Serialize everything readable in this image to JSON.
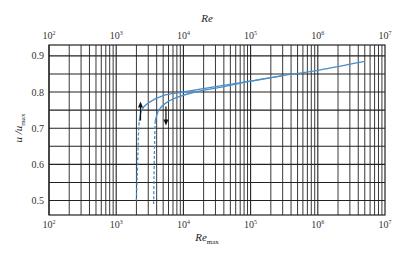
{
  "chart_data": {
    "type": "line",
    "title": "",
    "xlabel_top": "Re",
    "xlabel_bottom": "Re_max",
    "xlabel_bottom_main": "Re",
    "xlabel_bottom_sub": "max",
    "ylabel_main": "u /u",
    "ylabel_sub": "max",
    "x_scale": "log",
    "xlim": [
      100,
      10000000
    ],
    "ylim": [
      0.46,
      0.93
    ],
    "grid": true,
    "x_ticks": [
      {
        "value": 100,
        "base": "10",
        "exp": "2"
      },
      {
        "value": 1000,
        "base": "10",
        "exp": "3"
      },
      {
        "value": 10000,
        "base": "10",
        "exp": "4"
      },
      {
        "value": 100000,
        "base": "10",
        "exp": "5"
      },
      {
        "value": 1000000,
        "base": "10",
        "exp": "6"
      },
      {
        "value": 10000000,
        "base": "10",
        "exp": "7"
      }
    ],
    "y_ticks": [
      "0.5",
      "0.6",
      "0.7",
      "0.8",
      "0.9"
    ],
    "series": [
      {
        "name": "u/u_max vs Re (lower axis shift, left curve)",
        "color": "#4a8fc9",
        "laminar_dashed": {
          "x": [
            2000,
            2050,
            2100,
            2150,
            2200
          ],
          "y": [
            0.5,
            0.56,
            0.63,
            0.69,
            0.72
          ]
        },
        "turbulent": {
          "x": [
            2200,
            2400,
            3000,
            5000,
            10000,
            30000,
            100000,
            300000,
            1000000,
            5000000
          ],
          "y": [
            0.72,
            0.75,
            0.77,
            0.79,
            0.8,
            0.815,
            0.83,
            0.845,
            0.86,
            0.885
          ]
        }
      },
      {
        "name": "u/u_max vs Re_max (right curve)",
        "color": "#4a8fc9",
        "laminar_dashed": {
          "x": [
            3600,
            3650,
            3700,
            3750,
            3800
          ],
          "y": [
            0.49,
            0.56,
            0.63,
            0.68,
            0.72
          ]
        },
        "turbulent": {
          "x": [
            3800,
            4300,
            5500,
            8000,
            15000,
            40000,
            100000,
            300000
          ],
          "y": [
            0.72,
            0.75,
            0.77,
            0.785,
            0.8,
            0.815,
            0.83,
            0.845
          ]
        }
      }
    ],
    "annotations": [
      {
        "type": "arrow-up",
        "x": 2300,
        "y": 0.76
      },
      {
        "type": "arrow-down",
        "x": 5500,
        "y": 0.76
      }
    ]
  }
}
